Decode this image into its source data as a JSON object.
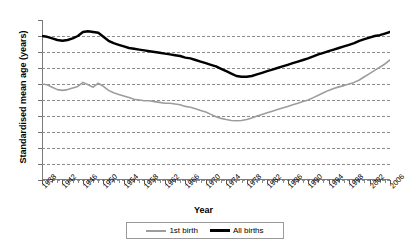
{
  "chart_data": {
    "type": "line",
    "title": "",
    "xlabel": "Year",
    "ylabel": "Standardised mean age (years)",
    "ylim": [
      20,
      30
    ],
    "xlim": [
      1938,
      2006
    ],
    "ytick_labels": [
      "30",
      "29",
      "28",
      "27",
      "26",
      "25",
      "24",
      "23",
      "22",
      "21",
      "20"
    ],
    "ytick_values": [
      30,
      29,
      28,
      27,
      26,
      25,
      24,
      23,
      22,
      21,
      20
    ],
    "xtick_labels": [
      "1938",
      "1942",
      "1946",
      "1950",
      "1954",
      "1958",
      "1962",
      "1966",
      "1970",
      "1974",
      "1978",
      "1982",
      "1986",
      "1990",
      "1994",
      "1998",
      "2002",
      "2006"
    ],
    "xtick_values": [
      1938,
      1942,
      1946,
      1950,
      1954,
      1958,
      1962,
      1966,
      1970,
      1974,
      1978,
      1982,
      1986,
      1990,
      1994,
      1998,
      2002,
      2006
    ],
    "grid": "horizontal-dashed",
    "legend_position": "bottom-center",
    "x": [
      1938,
      1939,
      1940,
      1941,
      1942,
      1943,
      1944,
      1945,
      1946,
      1947,
      1948,
      1949,
      1950,
      1951,
      1952,
      1953,
      1954,
      1955,
      1956,
      1957,
      1958,
      1959,
      1960,
      1961,
      1962,
      1963,
      1964,
      1965,
      1966,
      1967,
      1968,
      1969,
      1970,
      1971,
      1972,
      1973,
      1974,
      1975,
      1976,
      1977,
      1978,
      1979,
      1980,
      1981,
      1982,
      1983,
      1984,
      1985,
      1986,
      1987,
      1988,
      1989,
      1990,
      1991,
      1992,
      1993,
      1994,
      1995,
      1996,
      1997,
      1998,
      1999,
      2000,
      2001,
      2002,
      2003,
      2004,
      2005,
      2006
    ],
    "series": [
      {
        "name": "1st birth",
        "color": "#9d9d9d",
        "width": 1.6,
        "values": [
          26.0,
          25.95,
          25.8,
          25.65,
          25.6,
          25.65,
          25.75,
          25.85,
          26.1,
          25.95,
          25.8,
          26.05,
          25.85,
          25.6,
          25.45,
          25.35,
          25.25,
          25.15,
          25.05,
          25.0,
          24.95,
          24.95,
          24.9,
          24.85,
          24.8,
          24.8,
          24.75,
          24.7,
          24.6,
          24.55,
          24.45,
          24.35,
          24.25,
          24.1,
          23.95,
          23.85,
          23.78,
          23.72,
          23.7,
          23.72,
          23.78,
          23.88,
          24.0,
          24.1,
          24.2,
          24.3,
          24.4,
          24.5,
          24.6,
          24.7,
          24.8,
          24.9,
          25.0,
          25.15,
          25.3,
          25.45,
          25.6,
          25.72,
          25.82,
          25.9,
          26.0,
          26.1,
          26.25,
          26.45,
          26.65,
          26.85,
          27.05,
          27.25,
          27.5
        ]
      },
      {
        "name": "All births",
        "color": "#000000",
        "width": 2.4,
        "values": [
          29.0,
          28.95,
          28.85,
          28.75,
          28.7,
          28.75,
          28.85,
          29.0,
          29.25,
          29.3,
          29.25,
          29.2,
          28.95,
          28.7,
          28.55,
          28.45,
          28.35,
          28.25,
          28.2,
          28.15,
          28.1,
          28.05,
          28.0,
          27.95,
          27.9,
          27.85,
          27.8,
          27.75,
          27.65,
          27.6,
          27.5,
          27.4,
          27.3,
          27.2,
          27.1,
          26.95,
          26.8,
          26.65,
          26.5,
          26.45,
          26.45,
          26.5,
          26.6,
          26.7,
          26.8,
          26.9,
          27.0,
          27.1,
          27.2,
          27.3,
          27.4,
          27.5,
          27.6,
          27.72,
          27.85,
          27.95,
          28.05,
          28.15,
          28.25,
          28.35,
          28.45,
          28.55,
          28.7,
          28.8,
          28.9,
          29.0,
          29.05,
          29.15,
          29.25
        ]
      }
    ]
  },
  "legend": {
    "entries": [
      {
        "label": "1st birth"
      },
      {
        "label": "All births"
      }
    ]
  }
}
